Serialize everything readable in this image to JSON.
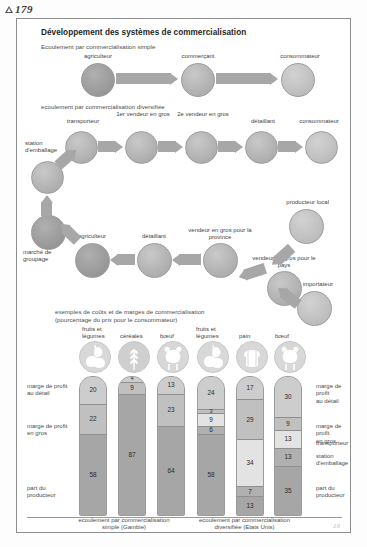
{
  "page": {
    "marker": "179",
    "folio": "19"
  },
  "title": "Développement des systèmes de commercialisation",
  "flow_simple": {
    "section_label": "Ecoulement par commercialisation simple",
    "nodes": [
      "agriculteur",
      "commerçant",
      "consommateur"
    ]
  },
  "flow_diversified": {
    "section_label": "ecoulement par commercialisation diversifiée",
    "row1": [
      "transporteur",
      "1er vendeur en gros",
      "2e vendeur en gros",
      "détaillant",
      "consommateur"
    ],
    "row1_sup": [
      "",
      "1",
      "2",
      "",
      ""
    ],
    "station": "station d'emballage",
    "row2": [
      "marché de groupage",
      "agriculteur",
      "détaillant",
      "vendeur en gros pour la province",
      "vendeur en gros pour le pays"
    ],
    "producteur_local": "producteur local",
    "importateur": "importateur"
  },
  "costs": {
    "heading_line1": "exemples de coûts et de marges de commercialisation",
    "heading_line2": "(pourcentage du prix pour le consommateur)"
  },
  "chart_data": {
    "type": "bar",
    "title": "exemples de coûts et de marges de commercialisation",
    "subtitle": "(pourcentage du prix pour le consommateur)",
    "ylabel": "pourcentage du prix pour le consommateur",
    "ylim": [
      0,
      100
    ],
    "stacked": true,
    "grid": false,
    "groups": [
      {
        "caption": "ecoulement par commercialisation simple (Gambie)",
        "categories": [
          "fruits et légumes",
          "céréales",
          "bœuf"
        ],
        "icons": [
          "fruits-vegetables-icon",
          "cereals-icon",
          "beef-icon"
        ],
        "bars": [
          {
            "category": "fruits et légumes",
            "segments": [
              {
                "name": "marge de profit au détail",
                "value": 20
              },
              {
                "name": "marge de profit en gros",
                "value": 22
              },
              {
                "name": "part du producteur",
                "value": 58
              }
            ]
          },
          {
            "category": "céréales",
            "segments": [
              {
                "name": "marge de profit au détail",
                "value": 4
              },
              {
                "name": "marge de profit en gros",
                "value": 9
              },
              {
                "name": "part du producteur",
                "value": 87
              }
            ]
          },
          {
            "category": "bœuf",
            "segments": [
              {
                "name": "marge de profit au détail",
                "value": 13
              },
              {
                "name": "marge de profit en gros",
                "value": 23
              },
              {
                "name": "part du producteur",
                "value": 64
              }
            ]
          }
        ]
      },
      {
        "caption": "ecoulement par commercialisation diversifiée (Etats Unis)",
        "categories": [
          "fruits et légumes",
          "pain",
          "bœuf"
        ],
        "icons": [
          "fruits-vegetables-icon",
          "bread-icon",
          "beef-icon"
        ],
        "bars": [
          {
            "category": "fruits et légumes",
            "segments": [
              {
                "name": "marge de profit au détail",
                "value": 24
              },
              {
                "name": "marge de profit en gros",
                "value": 3
              },
              {
                "name": "transporteur",
                "value": 9
              },
              {
                "name": "station d'emballage",
                "value": 6
              },
              {
                "name": "part du producteur",
                "value": 58
              }
            ]
          },
          {
            "category": "pain",
            "segments": [
              {
                "name": "marge de profit au détail",
                "value": 17
              },
              {
                "name": "marge de profit en gros",
                "value": 29
              },
              {
                "name": "transporteur",
                "value": 34
              },
              {
                "name": "station d'emballage",
                "value": 7
              },
              {
                "name": "part du producteur",
                "value": 13
              }
            ]
          },
          {
            "category": "bœuf",
            "segments": [
              {
                "name": "marge de profit au détail",
                "value": 30
              },
              {
                "name": "marge de profit en gros",
                "value": 9
              },
              {
                "name": "transporteur",
                "value": 13
              },
              {
                "name": "station d'emballage",
                "value": 13
              },
              {
                "name": "part du producteur",
                "value": 35
              }
            ]
          }
        ]
      }
    ],
    "legend_left": [
      "marge de profit au détail",
      "marge de profit en gros",
      "part du producteur"
    ],
    "legend_right": [
      "marge de profit au détail",
      "marge de profit en gros",
      "transporteur",
      "station d'emballage",
      "part du producteur"
    ],
    "legend_position": "both-sides",
    "colors": {
      "retail_margin": "#cdcdcd",
      "wholesale_margin": "#c0c0c0",
      "transporter": "#e3e3e3",
      "packing_station": "#b0b0b0",
      "producer_share": "#a6a6a6"
    }
  },
  "labels": {
    "legend_l1": "marge de profit",
    "legend_l1b": "au détail",
    "legend_l2": "marge de profit",
    "legend_l2b": "en gros",
    "legend_l3": "part du",
    "legend_l3b": "producteur",
    "legend_r1": "marge de profit",
    "legend_r1b": "au détail",
    "legend_r2": "marge de profit",
    "legend_r2b": "en gros",
    "legend_r3": "transporteur",
    "legend_r4": "station",
    "legend_r4b": "d'emballage",
    "legend_r5": "part du",
    "legend_r5b": "producteur"
  },
  "product_labels": {
    "g1": [
      "fruits et",
      "légumes",
      "céréales",
      "bœuf"
    ],
    "p1_l1": "fruits et",
    "p1_l2": "légumes",
    "p2": "céréales",
    "p3": "bœuf",
    "p4_l1": "fruits et",
    "p4_l2": "légumes",
    "p5": "pain",
    "p6": "bœuf"
  },
  "captions": {
    "left_l1": "ecoulement par commercialisation",
    "left_l2": "simple (Gambie)",
    "right_l1": "ecoulement par commercialisation",
    "right_l2": "diversifiée (Etats Unis)"
  }
}
